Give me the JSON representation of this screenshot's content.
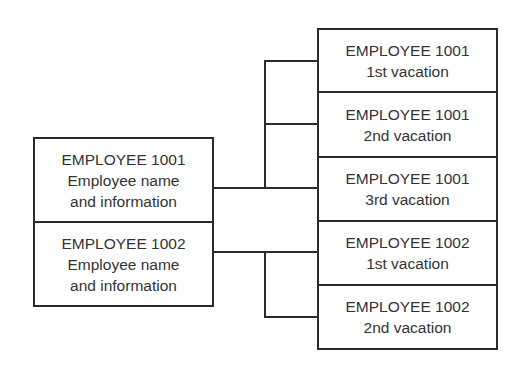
{
  "diagram": {
    "parents": [
      {
        "id": "EMPLOYEE 1001",
        "lines": [
          "EMPLOYEE 1001",
          "Employee name",
          "and information"
        ]
      },
      {
        "id": "EMPLOYEE 1002",
        "lines": [
          "EMPLOYEE 1002",
          "Employee name",
          "and information"
        ]
      }
    ],
    "children": [
      {
        "parent": "EMPLOYEE 1001",
        "lines": [
          "EMPLOYEE 1001",
          "1st vacation"
        ]
      },
      {
        "parent": "EMPLOYEE 1001",
        "lines": [
          "EMPLOYEE 1001",
          "2nd vacation"
        ]
      },
      {
        "parent": "EMPLOYEE 1001",
        "lines": [
          "EMPLOYEE 1001",
          "3rd vacation"
        ]
      },
      {
        "parent": "EMPLOYEE 1002",
        "lines": [
          "EMPLOYEE 1002",
          "1st vacation"
        ]
      },
      {
        "parent": "EMPLOYEE 1002",
        "lines": [
          "EMPLOYEE 1002",
          "2nd vacation"
        ]
      }
    ],
    "colors": {
      "stroke": "#2b2b2b",
      "text": "#333333",
      "background": "#ffffff"
    }
  }
}
